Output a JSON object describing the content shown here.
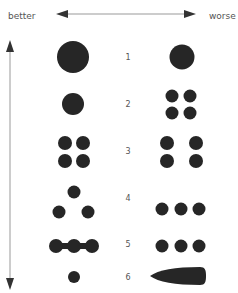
{
  "header": {
    "left_label": "better",
    "right_label": "worse"
  },
  "colors": {
    "shape_fill": "#262626",
    "arrow": "#888888",
    "arrowhead": "#333333",
    "text": "#555555"
  },
  "rows": [
    {
      "number": "1",
      "y": 57,
      "better": "single large circle",
      "worse": "single smaller circle"
    },
    {
      "number": "2",
      "y": 104,
      "better": "single medium circle",
      "worse": "four small circles in 2x2 grid"
    },
    {
      "number": "3",
      "y": 151,
      "better": "four circles tightly grouped 2x2",
      "worse": "four circles widely spaced 2x2"
    },
    {
      "number": "4",
      "y": 198,
      "better": "three circles in triangle",
      "worse": "three circles in a row"
    },
    {
      "number": "5",
      "y": 244,
      "better": "three circles connected by bar",
      "worse": "three separate circles in a row"
    },
    {
      "number": "6",
      "y": 277,
      "better": "single small circle",
      "worse": "elongated bullet shape"
    }
  ]
}
